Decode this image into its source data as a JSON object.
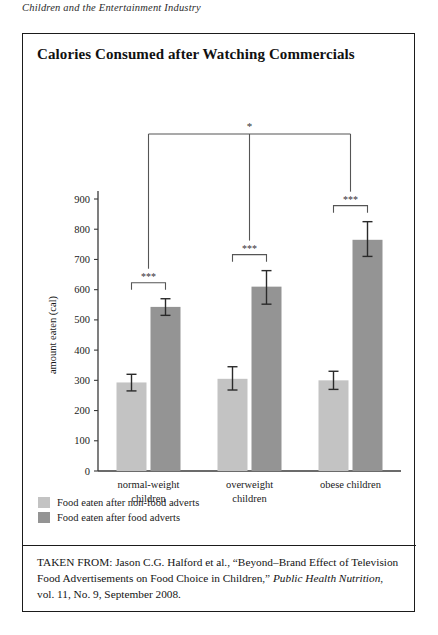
{
  "running_head": "Children and the Entertainment Industry",
  "figure": {
    "title": "Calories Consumed after Watching Commercials",
    "citation_prefix": "TAKEN FROM: Jason C.G. Halford et al., “Beyond–Brand Effect of Television Food Advertisements on Food Choice in Children,” ",
    "citation_journal": "Public Health Nutrition",
    "citation_suffix": ", vol. 11, No. 9, September 2008."
  },
  "colors": {
    "light_bar": "#c3c3c3",
    "dark_bar": "#949494",
    "axis": "#3a3a3a",
    "error_bar": "#2a2a2a",
    "bracket": "#555555"
  },
  "chart_data": {
    "type": "bar",
    "title": "Calories Consumed after Watching Commercials",
    "xlabel": "",
    "ylabel": "amount eaten (cal)",
    "ylim": [
      0,
      900
    ],
    "yticks": [
      0,
      100,
      200,
      300,
      400,
      500,
      600,
      700,
      800,
      900
    ],
    "grid": false,
    "legend_position": "below-left",
    "categories": [
      "normal-weight children",
      "overweight children",
      "obese children"
    ],
    "category_lines": [
      [
        "normal-weight",
        "children"
      ],
      [
        "overweight",
        "children"
      ],
      [
        "obese children",
        ""
      ]
    ],
    "series": [
      {
        "name": "Food eaten after non-food adverts",
        "color": "#c3c3c3",
        "values": [
          293,
          305,
          300
        ],
        "error_low": [
          265,
          268,
          270
        ],
        "error_high": [
          320,
          345,
          330
        ]
      },
      {
        "name": "Food eaten after food adverts",
        "color": "#949494",
        "values": [
          543,
          610,
          765
        ],
        "error_low": [
          515,
          552,
          710
        ],
        "error_high": [
          570,
          663,
          825
        ]
      }
    ],
    "annotations": [
      {
        "label": "***",
        "group": "normal-weight children",
        "type": "within-group-bracket"
      },
      {
        "label": "***",
        "group": "overweight children",
        "type": "within-group-bracket"
      },
      {
        "label": "***",
        "group": "obese children",
        "type": "within-group-bracket"
      },
      {
        "label": "*",
        "group": "all",
        "type": "across-group-bracket"
      }
    ]
  },
  "legend": [
    {
      "label": "Food eaten after non-food adverts",
      "color": "#c3c3c3"
    },
    {
      "label": "Food eaten after food adverts",
      "color": "#949494"
    }
  ]
}
